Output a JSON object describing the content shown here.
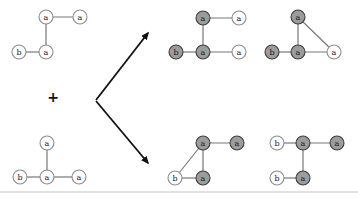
{
  "figure": {
    "operator": {
      "symbol": "+",
      "x": 53,
      "y": 102
    },
    "node_radius": 7,
    "colors": {
      "background": "#ffffff",
      "node_shared_fill": "#9c9c9c",
      "node_shared_border": "#3d3d3d",
      "node_plain_fill": "#ffffff",
      "node_plain_border": "#8c8c8c",
      "edge": "#787878",
      "arrow": "#111111",
      "label": "#1a1a1a",
      "baseline_rule": "#d8d8d8"
    },
    "arrows": [
      {
        "name": "arrow-to-top-results",
        "x1": 96,
        "y1": 100,
        "x2": 148,
        "y2": 33
      },
      {
        "name": "arrow-to-bottom-results",
        "x1": 96,
        "y1": 101,
        "x2": 148,
        "y2": 163
      }
    ],
    "baseline_rule": {
      "x1": 0,
      "y1": 192,
      "x2": 358,
      "y2": 192
    },
    "graphs": [
      {
        "name": "input-graph-1",
        "role": "input",
        "nodes": [
          {
            "label": "a",
            "x": 46,
            "y": 17,
            "shared": false
          },
          {
            "label": "a",
            "x": 80,
            "y": 17,
            "shared": false
          },
          {
            "label": "a",
            "x": 46,
            "y": 52,
            "shared": false
          },
          {
            "label": "b",
            "x": 19,
            "y": 52,
            "shared": false
          }
        ],
        "edges": [
          [
            0,
            1
          ],
          [
            0,
            2
          ],
          [
            2,
            3
          ]
        ]
      },
      {
        "name": "input-graph-2",
        "role": "input",
        "nodes": [
          {
            "label": "a",
            "x": 47,
            "y": 143,
            "shared": false
          },
          {
            "label": "a",
            "x": 47,
            "y": 177,
            "shared": false
          },
          {
            "label": "b",
            "x": 20,
            "y": 177,
            "shared": false
          },
          {
            "label": "a",
            "x": 79,
            "y": 177,
            "shared": false
          }
        ],
        "edges": [
          [
            0,
            1
          ],
          [
            1,
            2
          ],
          [
            1,
            3
          ]
        ]
      },
      {
        "name": "result-graph-1",
        "role": "result",
        "nodes": [
          {
            "label": "a",
            "x": 203,
            "y": 18,
            "shared": true
          },
          {
            "label": "a",
            "x": 239,
            "y": 18,
            "shared": false
          },
          {
            "label": "a",
            "x": 203,
            "y": 52,
            "shared": true
          },
          {
            "label": "b",
            "x": 176,
            "y": 52,
            "shared": true
          },
          {
            "label": "a",
            "x": 239,
            "y": 52,
            "shared": false
          }
        ],
        "edges": [
          [
            0,
            1
          ],
          [
            0,
            2
          ],
          [
            2,
            3
          ],
          [
            2,
            4
          ]
        ]
      },
      {
        "name": "result-graph-2",
        "role": "result",
        "nodes": [
          {
            "label": "a",
            "x": 298,
            "y": 17,
            "shared": true
          },
          {
            "label": "a",
            "x": 298,
            "y": 52,
            "shared": true
          },
          {
            "label": "b",
            "x": 272,
            "y": 52,
            "shared": true
          },
          {
            "label": "a",
            "x": 334,
            "y": 52,
            "shared": false
          }
        ],
        "edges": [
          [
            0,
            1
          ],
          [
            1,
            2
          ],
          [
            1,
            3
          ],
          [
            0,
            3
          ]
        ]
      },
      {
        "name": "result-graph-3",
        "role": "result",
        "nodes": [
          {
            "label": "a",
            "x": 203,
            "y": 143,
            "shared": true
          },
          {
            "label": "a",
            "x": 237,
            "y": 143,
            "shared": true
          },
          {
            "label": "a",
            "x": 203,
            "y": 178,
            "shared": true
          },
          {
            "label": "b",
            "x": 175,
            "y": 178,
            "shared": false
          }
        ],
        "edges": [
          [
            0,
            1
          ],
          [
            0,
            2
          ],
          [
            0,
            3
          ],
          [
            2,
            3
          ]
        ]
      },
      {
        "name": "result-graph-4",
        "role": "result",
        "nodes": [
          {
            "label": "b",
            "x": 277,
            "y": 143,
            "shared": false
          },
          {
            "label": "a",
            "x": 303,
            "y": 143,
            "shared": true
          },
          {
            "label": "a",
            "x": 337,
            "y": 143,
            "shared": true
          },
          {
            "label": "b",
            "x": 277,
            "y": 178,
            "shared": false
          },
          {
            "label": "a",
            "x": 303,
            "y": 178,
            "shared": true
          }
        ],
        "edges": [
          [
            0,
            1
          ],
          [
            1,
            2
          ],
          [
            1,
            4
          ],
          [
            3,
            4
          ]
        ]
      }
    ]
  }
}
